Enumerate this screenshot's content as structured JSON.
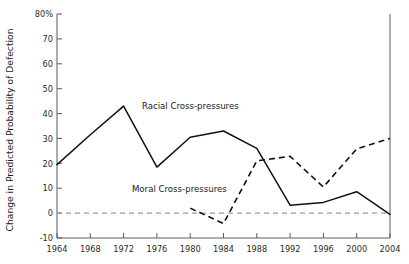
{
  "chart_data": {
    "type": "line",
    "title": "",
    "subtitle": "",
    "xlabel": "",
    "ylabel": "Change in Predicted Probability of Defection",
    "x": [
      1964,
      1968,
      1972,
      1976,
      1980,
      1984,
      1988,
      1992,
      1996,
      2000,
      2004
    ],
    "xtick_labels": [
      "1964",
      "1968",
      "1972",
      "1976",
      "1980",
      "1984",
      "1988",
      "1992",
      "1996",
      "2000",
      "2004"
    ],
    "ytick_labels": [
      "80%",
      "70",
      "60",
      "50",
      "40",
      "30",
      "20",
      "10",
      "0",
      "-10"
    ],
    "ytick_values": [
      80,
      70,
      60,
      50,
      40,
      30,
      20,
      10,
      0,
      -10
    ],
    "xlim": [
      1964,
      2004
    ],
    "ylim": [
      -10,
      80
    ],
    "grid": false,
    "legend_position": "inline-annotations",
    "zero_reference_line": 0,
    "series": [
      {
        "name": "Racial Cross-pressures",
        "style": "solid",
        "label_x": 1974.2,
        "label_y": 42.0,
        "x": [
          1964,
          1968,
          1972,
          1976,
          1980,
          1984,
          1988,
          1992,
          1996,
          2000,
          2004
        ],
        "values": [
          19.5,
          31.5,
          43.0,
          18.5,
          30.5,
          33.0,
          26.0,
          3.2,
          4.3,
          8.6,
          -0.5
        ]
      },
      {
        "name": "Moral Cross-pressures",
        "style": "dashed",
        "label_x": 1973.0,
        "label_y": 8.4,
        "x": [
          1980,
          1984,
          1988,
          1992,
          1996,
          2000,
          2004
        ],
        "values": [
          2.0,
          -4.2,
          21.0,
          22.8,
          10.5,
          25.8,
          30.0
        ]
      }
    ]
  }
}
